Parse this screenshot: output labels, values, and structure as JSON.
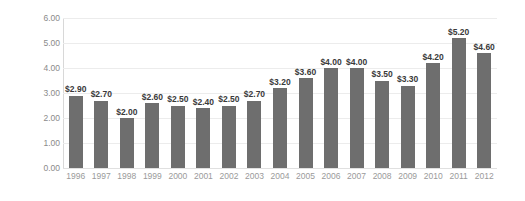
{
  "chart_data": {
    "type": "bar",
    "title": "",
    "xlabel": "",
    "ylabel": "$BILLIONS",
    "categories": [
      "1996",
      "1997",
      "1998",
      "1999",
      "2000",
      "2001",
      "2002",
      "2003",
      "2004",
      "2005",
      "2006",
      "2007",
      "2008",
      "2009",
      "2010",
      "2011",
      "2012"
    ],
    "values": [
      2.9,
      2.7,
      2.0,
      2.6,
      2.5,
      2.4,
      2.5,
      2.7,
      3.2,
      3.6,
      4.0,
      4.0,
      3.5,
      3.3,
      4.2,
      5.2,
      4.6
    ],
    "data_labels": [
      "$2.90",
      "$2.70",
      "$2.00",
      "$2.60",
      "$2.50",
      "$2.40",
      "$2.50",
      "$2.70",
      "$3.20",
      "$3.60",
      "$4.00",
      "$4.00",
      "$3.50",
      "$3.30",
      "$4.20",
      "$5.20",
      "$4.60"
    ],
    "ylim": [
      0,
      6
    ],
    "ytick_values": [
      0,
      1,
      2,
      3,
      4,
      5,
      6
    ],
    "ytick_labels": [
      "0.00",
      "1.00",
      "2.00",
      "3.00",
      "4.00",
      "5.00",
      "6.00"
    ],
    "grid": true,
    "legend": false,
    "colors": {
      "bar": "#6e6e6e",
      "gridline": "#ececec",
      "axis_line": "#d8d8d8",
      "data_label": "#3a3a3a",
      "tick_label": "#9a9a9a",
      "y_tick_label": "#8a8a8a",
      "axis_title": "#4d4d4d",
      "background": "#ffffff"
    }
  }
}
